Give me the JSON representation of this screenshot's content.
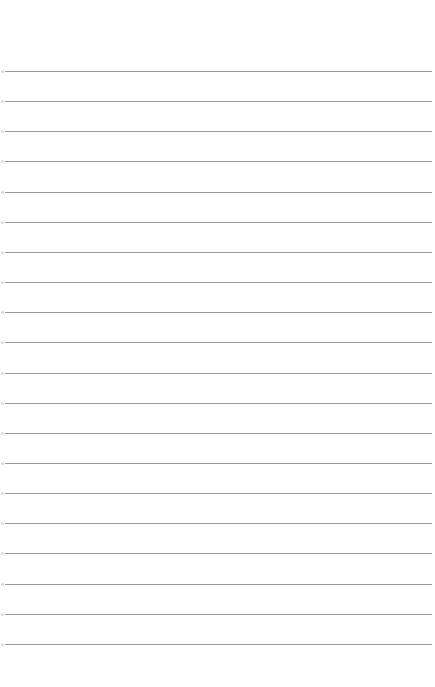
{
  "page": {
    "type": "lined-paper",
    "background_color": "#ffffff",
    "rule_color": "#9a9a9a",
    "rule_count": 20,
    "first_rule_y": 71,
    "rule_spacing": 30.15,
    "rule_left": 5,
    "rule_right": 432
  }
}
